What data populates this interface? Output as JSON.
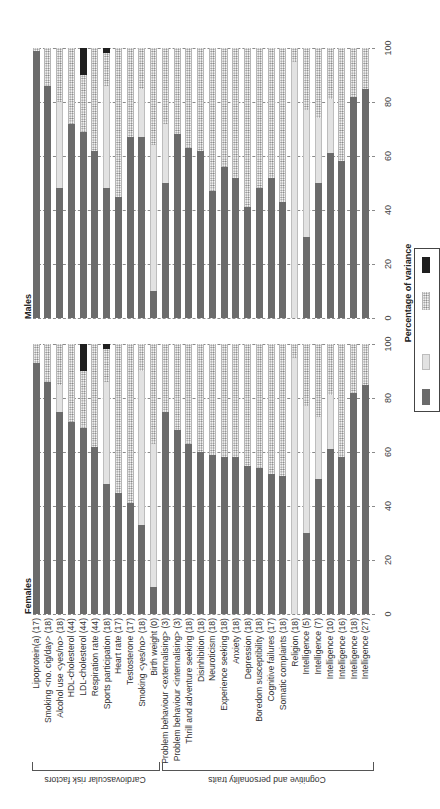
{
  "chart_data": {
    "type": "bar",
    "orientation": "stacked, figure rotated 90 degrees",
    "xlabel": "Percentage of variance",
    "ylim": [
      0,
      100
    ],
    "ticks": [
      0,
      20,
      40,
      60,
      80,
      100
    ],
    "grid": true,
    "groups": [
      {
        "label": "Cardiovascular risk factors",
        "start": 0,
        "end": 10
      },
      {
        "label": "Cognitive and personality traits",
        "start": 11,
        "end": 28
      }
    ],
    "categories": [
      "Lipoprotein(a) (17)",
      "Smoking <no. cig/day> (18)",
      "Alcohol use <yes/no> (18)",
      "HDL-cholesterol (44)",
      "LDL-cholesterol (44)",
      "Respiration rate (44)",
      "Sports participation (18)",
      "Heart rate (17)",
      "Testosterone (17)",
      "Smoking <yes/no> (18)",
      "Birth weight (0)",
      "Problem behaviour <externalising> (3)",
      "Problem behaviour <internalising> (3)",
      "Thrill and adventure seeking (18)",
      "Disinhibition (18)",
      "Neuroticism (18)",
      "Experience seeking (18)",
      "Anxiety (18)",
      "Depression (18)",
      "Boredom susceptibility (18)",
      "Cognitive failures (17)",
      "Somatic complaints (18)",
      "Religion (18)",
      "Intelligence (5)",
      "Intelligence (7)",
      "Intelligence (10)",
      "Intelligence (16)",
      "Intelligence (18)",
      "Intelligence (27)"
    ],
    "legend": [
      {
        "key": "dark",
        "color": "#6b6b6b",
        "label": ""
      },
      {
        "key": "light",
        "color": "#e2e2e2",
        "label": ""
      },
      {
        "key": "dots",
        "color": "dotted",
        "label": ""
      },
      {
        "key": "black",
        "color": "#1f1f1f",
        "label": ""
      }
    ],
    "panels": [
      {
        "title": "Males",
        "series": [
          {
            "name": "dark",
            "values": [
              99,
              86,
              48,
              72,
              69,
              62,
              48,
              45,
              67,
              67,
              10,
              50,
              68,
              63,
              62,
              47,
              56,
              52,
              41,
              48,
              52,
              43,
              0,
              30,
              50,
              61,
              58,
              82,
              85
            ]
          },
          {
            "name": "light",
            "values": [
              0,
              0,
              32,
              0,
              0,
              0,
              38,
              0,
              0,
              18,
              54,
              22,
              0,
              0,
              0,
              0,
              0,
              0,
              0,
              0,
              0,
              0,
              95,
              47,
              24,
              20,
              0,
              0,
              0
            ]
          },
          {
            "name": "dots",
            "values": [
              1,
              14,
              20,
              28,
              21,
              38,
              12,
              55,
              33,
              15,
              36,
              28,
              32,
              37,
              38,
              53,
              44,
              48,
              59,
              52,
              48,
              57,
              5,
              23,
              26,
              19,
              42,
              18,
              15
            ]
          },
          {
            "name": "black",
            "values": [
              0,
              0,
              0,
              0,
              10,
              0,
              2,
              0,
              0,
              0,
              0,
              0,
              0,
              0,
              0,
              0,
              0,
              0,
              0,
              0,
              0,
              0,
              0,
              0,
              0,
              0,
              0,
              0,
              0
            ]
          }
        ]
      },
      {
        "title": "Females",
        "series": [
          {
            "name": "dark",
            "values": [
              93,
              86,
              75,
              71,
              69,
              62,
              48,
              45,
              41,
              33,
              10,
              75,
              68,
              63,
              60,
              59,
              58,
              58,
              55,
              54,
              52,
              51,
              0,
              30,
              50,
              61,
              58,
              82,
              85
            ]
          },
          {
            "name": "light",
            "values": [
              0,
              0,
              10,
              0,
              0,
              0,
              38,
              0,
              0,
              57,
              53,
              0,
              0,
              0,
              0,
              0,
              0,
              0,
              0,
              0,
              0,
              0,
              95,
              47,
              23,
              20,
              0,
              0,
              0
            ]
          },
          {
            "name": "dots",
            "values": [
              7,
              14,
              15,
              29,
              21,
              38,
              12,
              55,
              59,
              10,
              37,
              25,
              32,
              37,
              40,
              41,
              42,
              42,
              45,
              46,
              48,
              49,
              5,
              23,
              27,
              19,
              42,
              18,
              15
            ]
          },
          {
            "name": "black",
            "values": [
              0,
              0,
              0,
              0,
              10,
              0,
              2,
              0,
              0,
              0,
              0,
              0,
              0,
              0,
              0,
              0,
              0,
              0,
              0,
              0,
              0,
              0,
              0,
              0,
              0,
              0,
              0,
              0,
              0
            ]
          }
        ]
      }
    ]
  },
  "labels": {
    "males": "Males",
    "females": "Females",
    "axis_title": "Percentage of variance",
    "group_cardio": "Cardiovascular risk factors",
    "group_cognitive": "Cognitive and personality traits"
  },
  "colors": {
    "dark": "#6b6b6b",
    "light": "#e2e2e2",
    "black": "#1f1f1f",
    "grid": "#8a8a8a"
  }
}
